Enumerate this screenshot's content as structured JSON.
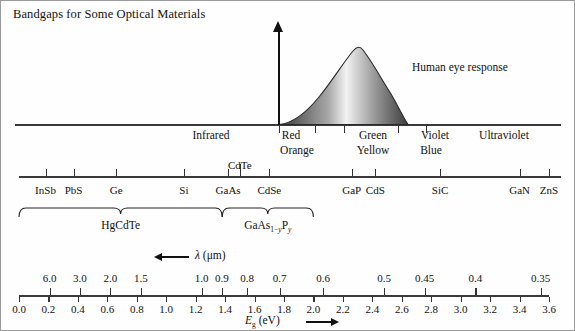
{
  "figure": {
    "title": "Bandgaps for Some Optical Materials",
    "eye_response_label": "Human eye response",
    "wavelength_axis_label": "λ (μm)",
    "energy_axis_label": "Eg (eV)",
    "energy_axis_symbol": "E",
    "energy_axis_sub": "g",
    "energy_axis_unit": "(eV)"
  },
  "spectrum_bands": [
    {
      "label": "Infrared",
      "x": 210
    },
    {
      "label": "Red",
      "x": 290
    },
    {
      "label": "Orange",
      "x": 296
    },
    {
      "label": "Green",
      "x": 372
    },
    {
      "label": "Yellow",
      "x": 372
    },
    {
      "label": "Violet",
      "x": 434
    },
    {
      "label": "Blue",
      "x": 430
    },
    {
      "label": "Ultraviolet",
      "x": 503
    }
  ],
  "spectrum_ticks": [
    278,
    314,
    343,
    397,
    425
  ],
  "materials": [
    {
      "name": "InSb",
      "eg": 0.18
    },
    {
      "name": "PbS",
      "eg": 0.37
    },
    {
      "name": "Ge",
      "eg": 0.66
    },
    {
      "name": "Si",
      "eg": 1.12
    },
    {
      "name": "GaAs",
      "eg": 1.42
    },
    {
      "name": "CdTe",
      "eg": 1.5
    },
    {
      "name": "CdSe",
      "eg": 1.7
    },
    {
      "name": "GaP",
      "eg": 2.26
    },
    {
      "name": "CdS",
      "eg": 2.42
    },
    {
      "name": "SiC",
      "eg": 2.86
    },
    {
      "name": "GaN",
      "eg": 3.4
    },
    {
      "name": "ZnS",
      "eg": 3.6
    }
  ],
  "alloy_braces": [
    {
      "label": "HgCdTe",
      "from_eg": 0.0,
      "to_eg": 1.38
    },
    {
      "label": "GaAs1-yPy",
      "from_eg": 1.38,
      "to_eg": 2.0
    }
  ],
  "chart_data": {
    "type": "line",
    "title": "Bandgaps for Some Optical Materials",
    "xlabel": "Eg (eV)",
    "ylabel": "",
    "xlim": [
      0.0,
      3.6
    ],
    "grid": false,
    "legend": "none",
    "x_ticks_ev": [
      "0.0",
      "0.2",
      "0.4",
      "0.6",
      "0.8",
      "1.0",
      "1.2",
      "1.4",
      "1.6",
      "1.8",
      "2.0",
      "2.2",
      "2.4",
      "2.6",
      "2.8",
      "3.0",
      "3.2",
      "3.4",
      "3.6"
    ],
    "secondary_axis": {
      "label": "λ (μm)",
      "direction": "decreasing-to-the-right",
      "ticks": [
        {
          "lambda_um": "6.0",
          "eg": 0.207
        },
        {
          "lambda_um": "3.0",
          "eg": 0.413
        },
        {
          "lambda_um": "2.0",
          "eg": 0.62
        },
        {
          "lambda_um": "1.5",
          "eg": 0.827
        },
        {
          "lambda_um": "1.0",
          "eg": 1.24
        },
        {
          "lambda_um": "0.9",
          "eg": 1.378
        },
        {
          "lambda_um": "0.8",
          "eg": 1.55
        },
        {
          "lambda_um": "0.7",
          "eg": 1.771
        },
        {
          "lambda_um": "0.6",
          "eg": 2.066
        },
        {
          "lambda_um": "0.5",
          "eg": 2.48
        },
        {
          "lambda_um": "0.45",
          "eg": 2.755
        },
        {
          "lambda_um": "0.4",
          "eg": 3.1
        },
        {
          "lambda_um": "0.35",
          "eg": 3.543
        }
      ]
    },
    "series": [
      {
        "name": "Human eye response",
        "x_start_eg": 1.72,
        "x_peak_eg": 2.25,
        "x_end_eg": 2.6,
        "peak_height_px": 79,
        "shading": "grayscale gradient dark-light-dark"
      }
    ],
    "annotations": [
      "Infrared",
      "Red",
      "Orange",
      "Green",
      "Yellow",
      "Blue",
      "Violet",
      "Ultraviolet",
      "Human eye response",
      "HgCdTe",
      "GaAs1-yPy"
    ]
  }
}
